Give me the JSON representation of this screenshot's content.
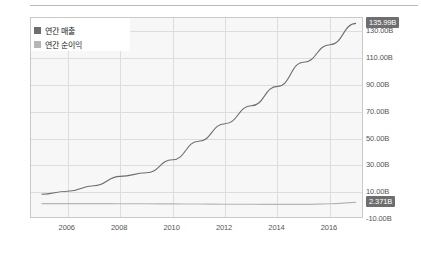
{
  "chart_data": {
    "type": "line",
    "title": "",
    "xlabel": "",
    "ylabel": "",
    "grid": true,
    "legend_position": "top-left",
    "x": [
      2005,
      2006,
      2007,
      2008,
      2009,
      2010,
      2011,
      2012,
      2013,
      2014,
      2015,
      2016,
      2017
    ],
    "xlim": [
      2004.6,
      2017.3
    ],
    "ylim": [
      -10,
      140
    ],
    "xticks": [
      "2006",
      "2008",
      "2010",
      "2012",
      "2014",
      "2016"
    ],
    "yticks": [
      "130.00B",
      "110.00B",
      "90.00B",
      "70.00B",
      "50.00B",
      "30.00B",
      "10.00B",
      "-10.00B"
    ],
    "ytick_values": [
      130,
      110,
      90,
      70,
      50,
      30,
      10,
      -10
    ],
    "series": [
      {
        "name": "연간 매출",
        "color": "#6e6e6e",
        "end_label": "135.99B",
        "end_value": 135.99,
        "values": [
          8.49,
          10.71,
          14.84,
          21.8,
          24.51,
          34.2,
          48.08,
          61.09,
          74.45,
          88.99,
          107.01,
          120.0,
          135.99
        ]
      },
      {
        "name": "연간 순이익",
        "color": "#b5b5b5",
        "end_label": "2.371B",
        "end_value": 2.371,
        "values": [
          1.46,
          1.47,
          1.49,
          1.43,
          1.37,
          1.28,
          1.2,
          1.08,
          0.99,
          0.92,
          0.86,
          1.35,
          2.371
        ]
      }
    ]
  },
  "axis": {
    "badge_top": "135.99B",
    "badge_bottom": "2.371B"
  }
}
